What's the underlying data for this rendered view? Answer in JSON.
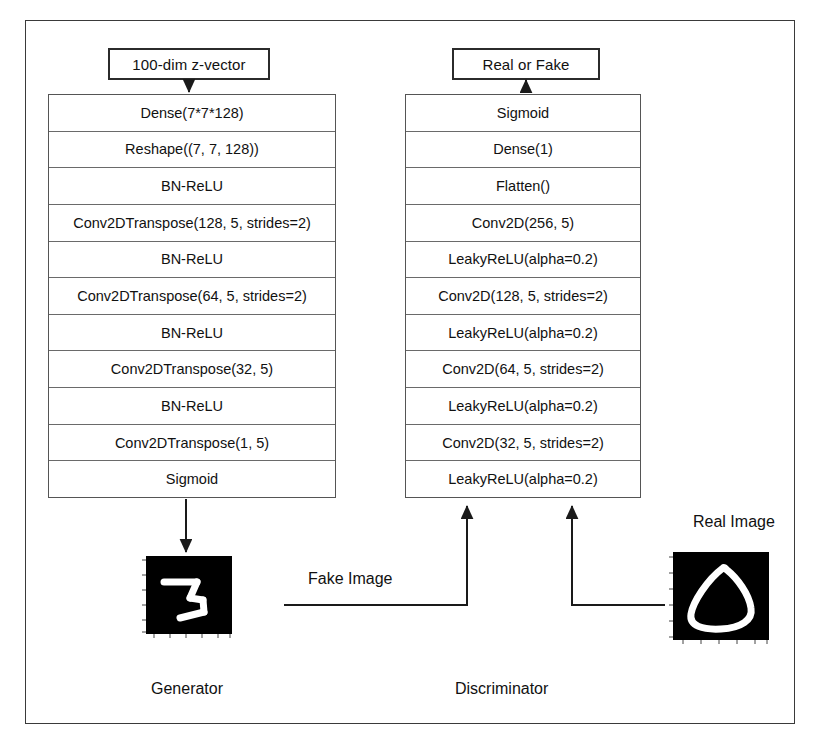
{
  "diagram": {
    "frame_color": "#3a3a3a",
    "background": "#ffffff"
  },
  "generator": {
    "input_box_label": "100-dim z-vector",
    "caption": "Generator",
    "layers": [
      "Dense(7*7*128)",
      "Reshape((7, 7, 128))",
      "BN-ReLU",
      "Conv2DTranspose(128, 5, strides=2)",
      "BN-ReLU",
      "Conv2DTranspose(64, 5, strides=2)",
      "BN-ReLU",
      "Conv2DTranspose(32, 5)",
      "BN-ReLU",
      "Conv2DTranspose(1, 5)",
      "Sigmoid"
    ],
    "output_image_label": "Fake Image",
    "output_digit": "3"
  },
  "discriminator": {
    "output_box_label": "Real or Fake",
    "caption": "Discriminator",
    "layers": [
      "Sigmoid",
      "Dense(1)",
      "Flatten()",
      "Conv2D(256, 5)",
      "LeakyReLU(alpha=0.2)",
      "Conv2D(128, 5, strides=2)",
      "LeakyReLU(alpha=0.2)",
      "Conv2D(64, 5, strides=2)",
      "LeakyReLU(alpha=0.2)",
      "Conv2D(32, 5, strides=2)",
      "LeakyReLU(alpha=0.2)"
    ]
  },
  "real_sample": {
    "label": "Real Image",
    "digit": "0"
  },
  "flow_labels": {
    "fake_image": "Fake Image"
  }
}
